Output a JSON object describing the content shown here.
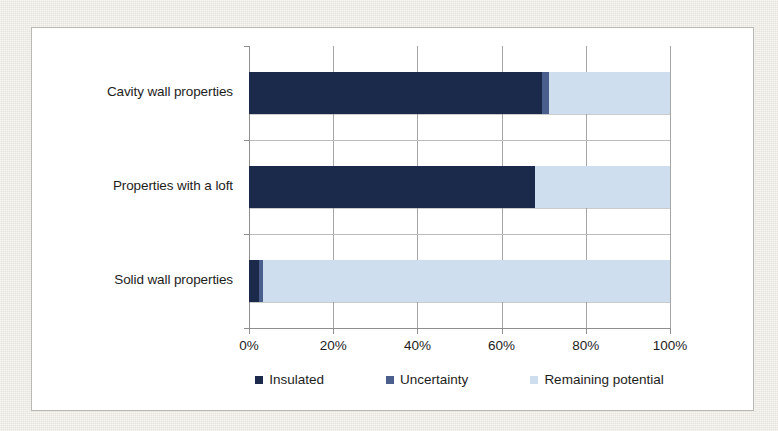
{
  "page": {
    "background_color": "#edebe4",
    "card_background": "#ffffff",
    "card_border_color": "#b9b9b4"
  },
  "chart_data": {
    "type": "bar",
    "orientation": "horizontal",
    "stacked": true,
    "stack_mode": "percent",
    "title": "",
    "subtitle": "",
    "xlabel": "",
    "ylabel": "",
    "xlim": [
      0,
      100
    ],
    "xticks": [
      0,
      20,
      40,
      60,
      80,
      100
    ],
    "xtick_labels": [
      "0%",
      "20%",
      "40%",
      "60%",
      "80%",
      "100%"
    ],
    "grid": true,
    "grid_axis": "x",
    "legend_position": "bottom",
    "categories": [
      "Cavity wall properties",
      "Properties with a loft",
      "Solid wall properties"
    ],
    "series": [
      {
        "name": "Insulated",
        "color": "#1b2a4a",
        "values": [
          69.5,
          68.0,
          2.4
        ]
      },
      {
        "name": "Uncertainty",
        "color": "#4a5f8c",
        "values": [
          1.7,
          0.0,
          1.0
        ]
      },
      {
        "name": "Remaining potential",
        "color": "#cedeef",
        "values": [
          28.8,
          32.0,
          96.6
        ]
      }
    ]
  },
  "axis": {
    "tick_labels": [
      "0%",
      "20%",
      "40%",
      "60%",
      "80%",
      "100%"
    ],
    "category_labels": [
      "Cavity wall properties",
      "Properties with a loft",
      "Solid wall properties"
    ]
  },
  "legend": {
    "items": [
      {
        "label": "Insulated",
        "color": "#1b2a4a"
      },
      {
        "label": "Uncertainty",
        "color": "#4a5f8c"
      },
      {
        "label": "Remaining potential",
        "color": "#cedeef"
      }
    ]
  }
}
